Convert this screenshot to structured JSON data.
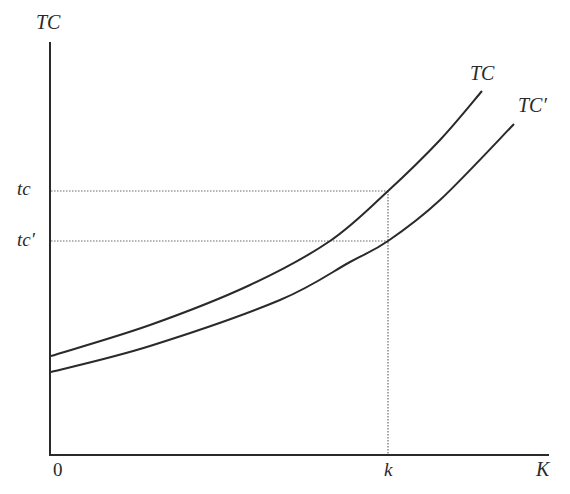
{
  "chart_data": {
    "type": "line",
    "title": "",
    "xlabel": "K",
    "ylabel": "TC",
    "origin_label": "0",
    "x_ticks": [
      {
        "label": "k",
        "x": 388
      }
    ],
    "y_ticks": [
      {
        "label": "tc",
        "y": 191
      },
      {
        "label": "tc′",
        "y": 241
      }
    ],
    "grid": false,
    "series": [
      {
        "name": "TC",
        "label": "TC",
        "points_px": [
          [
            51,
            356
          ],
          [
            150,
            325
          ],
          [
            250,
            285
          ],
          [
            330,
            241
          ],
          [
            388,
            191
          ],
          [
            440,
            140
          ],
          [
            482,
            91
          ]
        ]
      },
      {
        "name": "TC′",
        "label": "TC′",
        "points_px": [
          [
            51,
            372
          ],
          [
            150,
            346
          ],
          [
            280,
            300
          ],
          [
            350,
            262
          ],
          [
            388,
            241
          ],
          [
            440,
            200
          ],
          [
            514,
            124
          ]
        ]
      }
    ],
    "guides": [
      {
        "type": "horizontal-dotted",
        "label": "tc",
        "from_x": 51,
        "to_x": 388,
        "y": 191
      },
      {
        "type": "horizontal-dotted",
        "label": "tc′",
        "from_x": 51,
        "to_x": 388,
        "y": 241
      },
      {
        "type": "vertical-dotted",
        "label": "k",
        "x": 388,
        "from_y": 191,
        "to_y": 455
      }
    ],
    "axes": {
      "origin": [
        50,
        455
      ],
      "y_top": 42,
      "x_right": 549
    }
  },
  "labels": {
    "y_axis": "TC",
    "x_axis": "K",
    "origin": "0",
    "k": "k",
    "tc": "tc",
    "tc_prime": "tc′",
    "curve_tc": "TC",
    "curve_tc_prime": "TC′"
  },
  "colors": {
    "line": "#2a2a2a",
    "dotted": "#6a6a6a",
    "background": "#ffffff"
  }
}
